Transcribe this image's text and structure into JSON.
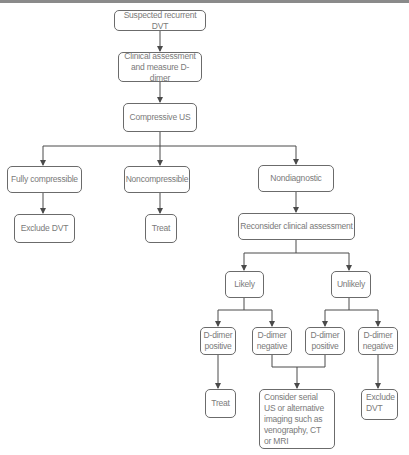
{
  "flowchart": {
    "nodes": {
      "start": "Suspected recurrent DVT",
      "clinical": "Clinical assessment and measure D-dimer",
      "cus": "Compressive US",
      "fully": "Fully compressible",
      "noncomp": "Noncompressible",
      "nondiag": "Nondiagnostic",
      "exclude1": "Exclude DVT",
      "treat1": "Treat",
      "reconsider": "Reconsider clinical assessment",
      "likely": "Likely",
      "unlikely": "Unlikely",
      "lpos": "D-dimer positive",
      "lneg": "D-dimer negative",
      "upos": "D-dimer positive",
      "uneg": "D-dimer negative",
      "treat2": "Treat",
      "consider": "Consider serial US or alternative imaging such as venography, CT or MRI",
      "exclude2": "Exclude DVT"
    },
    "colors": {
      "border": "#6b6b6b",
      "text": "#7a7a7a",
      "line": "#4a4a4a",
      "topbar": "#8a8a8a"
    }
  }
}
